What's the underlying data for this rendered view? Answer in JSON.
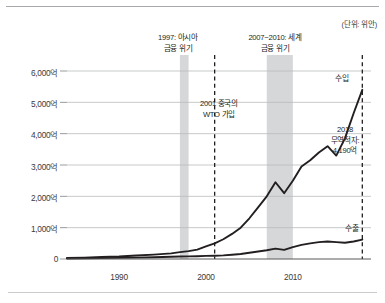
{
  "unit_note": "(단위: 위안)",
  "annotations": {
    "crisis_1997_line1": "1997: 아시아",
    "crisis_1997_line2": "금융 위기",
    "crisis_2007_line1": "2007~2010: 세계",
    "crisis_2007_line2": "금융 위기",
    "wto_line1": "2001 중국의",
    "wto_line2": "WTO 가입",
    "deficit_line1": "2018",
    "deficit_line2": "무역적자:",
    "deficit_line3": "4,190억"
  },
  "series_labels": {
    "import": "수입",
    "export": "수출"
  },
  "chart_data": {
    "type": "line",
    "title": "",
    "subtitle": "",
    "xlabel": "",
    "ylabel": "",
    "unit": "(단위: 위안)",
    "xlim": [
      1984,
      2019
    ],
    "ylim": [
      0,
      6000
    ],
    "grid": true,
    "legend_position": "inline-right",
    "xticks": [
      1990,
      2000,
      2010
    ],
    "xtick_labels": [
      "1990",
      "2000",
      "2010"
    ],
    "yticks": [
      0,
      1000,
      2000,
      3000,
      4000,
      5000,
      6000
    ],
    "ytick_labels": [
      "0",
      "1,000억",
      "2,000억",
      "3,000억",
      "4,000억",
      "5,000억",
      "6,000억"
    ],
    "x": [
      1984,
      1986,
      1988,
      1990,
      1992,
      1994,
      1996,
      1997,
      1998,
      1999,
      2000,
      2001,
      2002,
      2003,
      2004,
      2005,
      2006,
      2007,
      2008,
      2009,
      2010,
      2011,
      2012,
      2013,
      2014,
      2015,
      2016,
      2017,
      2018
    ],
    "series": [
      {
        "name": "수입",
        "color": "#231f20",
        "values": [
          30,
          45,
          65,
          80,
          110,
          140,
          180,
          220,
          250,
          300,
          400,
          500,
          630,
          800,
          1000,
          1300,
          1650,
          2000,
          2450,
          2100,
          2500,
          2950,
          3150,
          3400,
          3600,
          3300,
          3850,
          4650,
          5400
        ]
      },
      {
        "name": "수출",
        "color": "#231f20",
        "values": [
          15,
          20,
          28,
          35,
          45,
          55,
          70,
          80,
          85,
          90,
          100,
          105,
          115,
          135,
          160,
          200,
          240,
          280,
          330,
          290,
          380,
          450,
          500,
          540,
          560,
          540,
          520,
          560,
          620
        ]
      }
    ],
    "shaded_bands": [
      {
        "label": "1997: 아시아 금융 위기",
        "from": 1997,
        "to": 1998,
        "color": "#d6d7d8"
      },
      {
        "label": "2007~2010: 세계 금융 위기",
        "from": 2007,
        "to": 2010,
        "color": "#d6d7d8"
      }
    ],
    "vertical_markers": [
      {
        "label": "2001 중국의 WTO 가입",
        "x": 2001,
        "style": "dashed"
      },
      {
        "label": "2018 무역적자: 4,190억",
        "x": 2018,
        "style": "dashed"
      }
    ],
    "callouts": [
      {
        "text": "2018 무역적자: 4,190억",
        "value": 4190,
        "at_x": 2018
      }
    ]
  }
}
